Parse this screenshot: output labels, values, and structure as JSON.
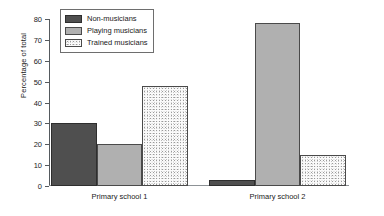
{
  "chart_data": {
    "type": "bar",
    "title": "",
    "xlabel": "",
    "ylabel": "Percentage of total",
    "categories": [
      "Primary school 1",
      "Primary school 2"
    ],
    "series": [
      {
        "name": "Non-musicians",
        "values": [
          30,
          3
        ],
        "color": "#4f4f4f",
        "fill": "solid-dark-gray"
      },
      {
        "name": "Playing musicians",
        "values": [
          20,
          78
        ],
        "color": "#b0b0b0",
        "fill": "solid-medium-gray"
      },
      {
        "name": "Trained musicians",
        "values": [
          48,
          15
        ],
        "color": "#fbfbfb",
        "fill": "stippled-light"
      }
    ],
    "ylim": [
      0,
      80
    ],
    "yticks": [
      0,
      10,
      20,
      30,
      40,
      50,
      60,
      70,
      80
    ],
    "ytick_labels": [
      "0",
      "10",
      "20",
      "30",
      "40",
      "50",
      "60",
      "70",
      "80"
    ],
    "grid": false,
    "legend_position": "upper left"
  },
  "legend": {
    "items": [
      {
        "label": "Non-musicians"
      },
      {
        "label": "Playing musicians"
      },
      {
        "label": "Trained musicians"
      }
    ]
  }
}
